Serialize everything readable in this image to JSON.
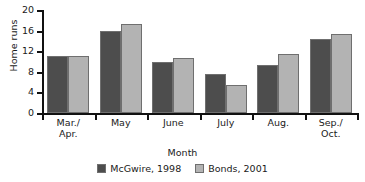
{
  "chart_data": {
    "type": "bar",
    "title": "",
    "xlabel": "Month",
    "ylabel": "Home runs",
    "categories": [
      "Mar./\nApr.",
      "May",
      "June",
      "July",
      "Aug.",
      "Sep./\nOct."
    ],
    "category_labels": [
      [
        "Mar./",
        "Apr."
      ],
      [
        "May",
        ""
      ],
      [
        "June",
        ""
      ],
      [
        "July",
        ""
      ],
      [
        "Aug.",
        ""
      ],
      [
        "Sep./",
        "Oct."
      ]
    ],
    "series": [
      {
        "name": "McGwire, 1998",
        "color": "#4d4d4d",
        "values": [
          11,
          16,
          9.9,
          7.6,
          9.3,
          14.4
        ]
      },
      {
        "name": "Bonds, 2001",
        "color": "#b3b3b3",
        "values": [
          11,
          17.2,
          10.7,
          5.4,
          11.5,
          15.4
        ]
      }
    ],
    "ylim": [
      0,
      20
    ],
    "yticks": [
      0,
      4,
      8,
      12,
      16,
      20
    ],
    "ytick_labels": [
      "0",
      "4",
      "8",
      "12",
      "16",
      "20"
    ],
    "grid": false,
    "legend_position": "bottom"
  },
  "legend": {
    "entries": [
      {
        "label": "McGwire, 1998",
        "color": "#4d4d4d"
      },
      {
        "label": "Bonds, 2001",
        "color": "#b3b3b3"
      }
    ]
  },
  "axes": {
    "y_title": "Home runs",
    "x_title": "Month"
  }
}
